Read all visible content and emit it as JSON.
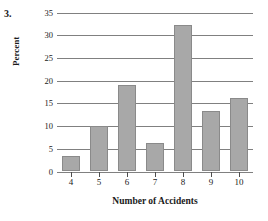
{
  "problem": {
    "number": "3."
  },
  "chart_data": {
    "type": "bar",
    "title": "",
    "xlabel": "Number of Accidents",
    "ylabel": "Percent",
    "categories": [
      "4",
      "5",
      "6",
      "7",
      "8",
      "9",
      "10"
    ],
    "values": [
      3.4,
      10.0,
      19.0,
      6.2,
      32.2,
      13.2,
      16.1
    ],
    "ylim": [
      0,
      35
    ],
    "yticks": [
      "0",
      "5",
      "10",
      "15",
      "20",
      "25",
      "30",
      "35"
    ],
    "ytick_values": [
      0,
      5,
      10,
      15,
      20,
      25,
      30,
      35
    ],
    "grid": true,
    "legend": false,
    "bar_color": "#a8a8a8",
    "bar_edge_color": "#8a8a8a",
    "grid_color": "#808080",
    "background": "#ffffff"
  }
}
